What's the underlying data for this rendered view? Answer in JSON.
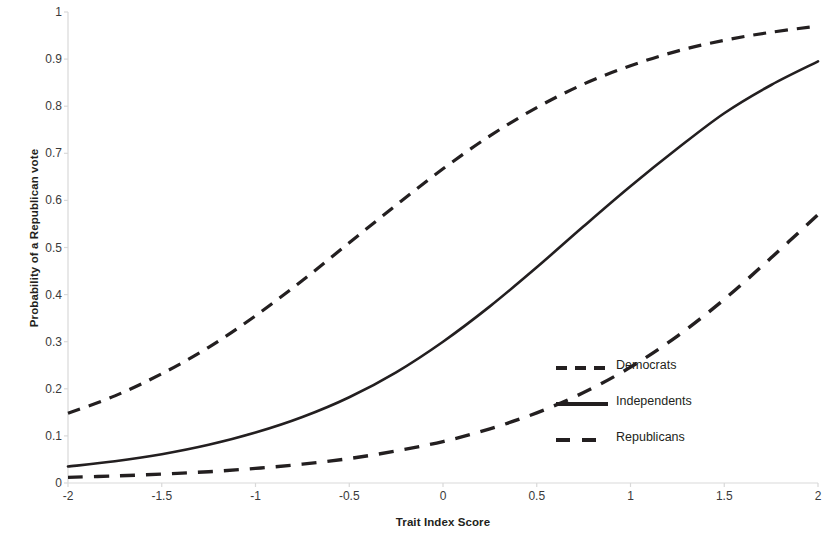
{
  "chart_data": {
    "type": "line",
    "title": "",
    "xlabel": "Trait Index Score",
    "ylabel": "Probability of a Republican vote",
    "xlim": [
      -2,
      2
    ],
    "ylim": [
      0,
      1
    ],
    "grid": false,
    "legend_position": "inside-right",
    "xticks": [
      "-2",
      "-1.5",
      "-1",
      "-0.5",
      "0",
      "0.5",
      "1",
      "1.5",
      "2"
    ],
    "xtick_values": [
      -2,
      -1.5,
      -1,
      -0.5,
      0,
      0.5,
      1,
      1.5,
      2
    ],
    "yticks": [
      "0",
      "0.1",
      "0.2",
      "0.3",
      "0.4",
      "0.5",
      "0.6",
      "0.7",
      "0.8",
      "0.9",
      "1"
    ],
    "ytick_values": [
      0,
      0.1,
      0.2,
      0.3,
      0.4,
      0.5,
      0.6,
      0.7,
      0.8,
      0.9,
      1
    ],
    "x": [
      -2,
      -1.75,
      -1.5,
      -1.25,
      -1,
      -0.75,
      -0.5,
      -0.25,
      0,
      0.25,
      0.5,
      0.75,
      1,
      1.25,
      1.5,
      1.75,
      2
    ],
    "series": [
      {
        "name": "Democrats",
        "style": "dashed",
        "color": "#231f20",
        "values": [
          0.148,
          0.185,
          0.232,
          0.288,
          0.355,
          0.43,
          0.51,
          0.59,
          0.667,
          0.737,
          0.797,
          0.847,
          0.886,
          0.917,
          0.94,
          0.957,
          0.97
        ]
      },
      {
        "name": "Independents",
        "style": "solid",
        "color": "#231f20",
        "values": [
          0.035,
          0.046,
          0.061,
          0.081,
          0.107,
          0.14,
          0.182,
          0.235,
          0.3,
          0.375,
          0.458,
          0.545,
          0.63,
          0.71,
          0.785,
          0.845,
          0.895
        ]
      },
      {
        "name": "Republicans",
        "style": "dashed-long",
        "color": "#231f20",
        "values": [
          0.012,
          0.015,
          0.019,
          0.024,
          0.031,
          0.04,
          0.052,
          0.068,
          0.088,
          0.115,
          0.149,
          0.192,
          0.246,
          0.312,
          0.39,
          0.478,
          0.57
        ]
      }
    ],
    "legend": [
      {
        "label": "Democrats",
        "style": "dashed"
      },
      {
        "label": "Independents",
        "style": "solid"
      },
      {
        "label": "Republicans",
        "style": "dashed-long"
      }
    ],
    "annotations": []
  },
  "colors": {
    "ink": "#231f20",
    "axis": "#d9d9d9",
    "tick_text": "#3a3a3a"
  }
}
